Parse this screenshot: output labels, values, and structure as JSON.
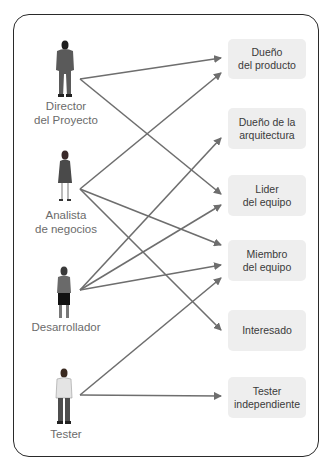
{
  "actors": [
    {
      "id": "director",
      "label": "Director\ndel Proyecto",
      "line1": "Director",
      "line2": "del Proyecto",
      "icon": "person-suit-icon"
    },
    {
      "id": "analista",
      "label": "Analista\nde negocios",
      "line1": "Analista",
      "line2": "de negocios",
      "icon": "person-dress-icon"
    },
    {
      "id": "desarrollador",
      "label": "Desarrollador",
      "line1": "Desarrollador",
      "line2": "",
      "icon": "person-shorts-icon"
    },
    {
      "id": "tester",
      "label": "Tester",
      "line1": "Tester",
      "line2": "",
      "icon": "person-casual-icon"
    }
  ],
  "roles": [
    {
      "id": "dueno_producto",
      "label": "Dueño\ndel producto"
    },
    {
      "id": "dueno_arquitectura",
      "label": "Dueño de la\narquitectura"
    },
    {
      "id": "lider_equipo",
      "label": "Lider\ndel equipo"
    },
    {
      "id": "miembro_equipo",
      "label": "Miembro\ndel equipo"
    },
    {
      "id": "interesado",
      "label": "Interesado"
    },
    {
      "id": "tester_independiente",
      "label": "Tester\nindependiente"
    }
  ],
  "connections": [
    {
      "from": "director",
      "to": "dueno_producto"
    },
    {
      "from": "director",
      "to": "lider_equipo"
    },
    {
      "from": "analista",
      "to": "dueno_producto"
    },
    {
      "from": "analista",
      "to": "miembro_equipo"
    },
    {
      "from": "analista",
      "to": "interesado"
    },
    {
      "from": "desarrollador",
      "to": "dueno_arquitectura"
    },
    {
      "from": "desarrollador",
      "to": "lider_equipo"
    },
    {
      "from": "desarrollador",
      "to": "miembro_equipo"
    },
    {
      "from": "tester",
      "to": "miembro_equipo"
    },
    {
      "from": "tester",
      "to": "tester_independiente"
    }
  ],
  "colors": {
    "arrow": "#6e6e6e",
    "role_box": "#eeeeee",
    "frame": "#2a2a2a",
    "actor_text": "#6b6b6b",
    "role_text": "#3a3a3a"
  }
}
